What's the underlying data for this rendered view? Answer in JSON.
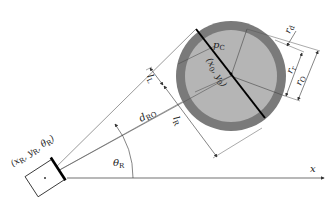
{
  "diagram": {
    "robot": {
      "pose_label": "(x",
      "pose_full": "(xR, yR, θR)",
      "x_sub": "R",
      "y": "y",
      "y_sub": "R",
      "theta": "θ",
      "theta_sub": "R",
      "close": ")"
    },
    "axis": {
      "x_label": "x"
    },
    "angle": {
      "label": "θ",
      "sub": "R"
    },
    "distance": {
      "label": "d",
      "sub": "RO"
    },
    "obstacle": {
      "center_label": "(x0, y0)",
      "center_x": "x",
      "center_x_sub": "0",
      "center_y": "y",
      "center_y_sub": "0",
      "contact_label": "p",
      "contact_sub": "C",
      "outer_color": "#7a7a7a",
      "inner_color": "#b5b5b5"
    },
    "dimensions": {
      "lL": {
        "label": "l",
        "sub": "L"
      },
      "lR": {
        "label": "l",
        "sub": "R"
      },
      "rd": {
        "label": "r",
        "sub": "d"
      },
      "rr": {
        "label": "r",
        "sub": "r"
      },
      "rO": {
        "label": "r",
        "sub": "O"
      }
    }
  }
}
